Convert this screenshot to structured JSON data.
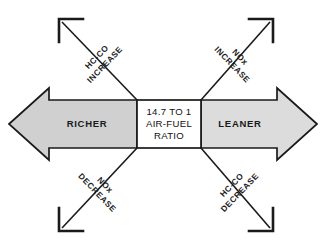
{
  "diagram": {
    "center_box": {
      "lines": [
        "14.7 TO 1",
        "AIR-FUEL",
        "RATIO"
      ]
    },
    "horizontal_arrows": {
      "left": {
        "label": "RICHER",
        "direction": "left",
        "fill": "#d0d0d0"
      },
      "right": {
        "label": "LEANER",
        "direction": "right",
        "fill": "#dcdcdc"
      }
    },
    "diagonal_arrows": [
      {
        "id": "upper-left",
        "line1": "HC-CO",
        "line2": "INCREASE",
        "direction": "up-left"
      },
      {
        "id": "upper-right",
        "line1": "NOx",
        "line2": "INCREASE",
        "direction": "up-right"
      },
      {
        "id": "lower-left",
        "line1": "NOx",
        "line2": "DECREASE",
        "direction": "down-left"
      },
      {
        "id": "lower-right",
        "line1": "HC-CO",
        "line2": "DECREASE",
        "direction": "down-right"
      }
    ],
    "colors": {
      "stroke": "#1a1a1a",
      "center_fill": "#ffffff",
      "background": "#ffffff"
    }
  }
}
